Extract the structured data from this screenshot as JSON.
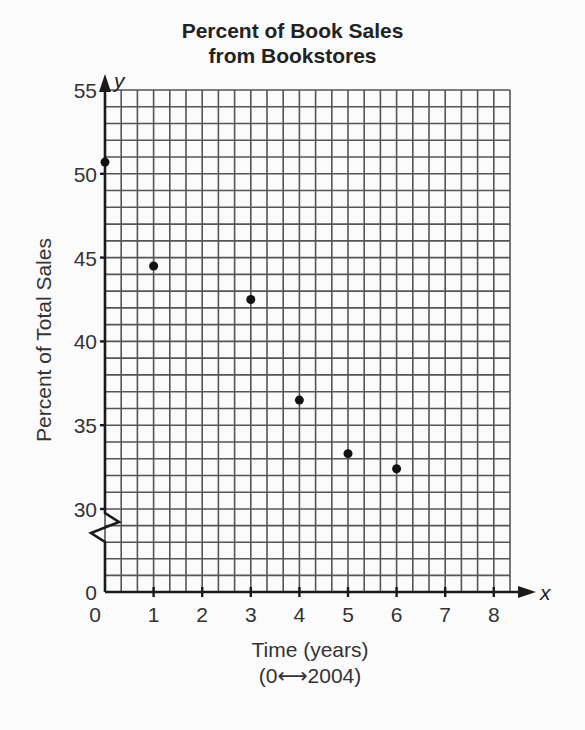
{
  "title": {
    "line1": "Percent of Book Sales",
    "line2": "from Bookstores"
  },
  "axes": {
    "y_letter": "y",
    "x_letter": "x",
    "y_title": "Percent of Total Sales",
    "x_title_line1": "Time (years)",
    "x_title_line2": "(0⟷2004)"
  },
  "chart_data": {
    "type": "scatter",
    "title": "Percent of Book Sales from Bookstores",
    "xlabel": "Time (years) (0 ↔ 2004)",
    "ylabel": "Percent of Total Sales",
    "x": [
      0,
      1,
      3,
      4,
      5,
      6
    ],
    "y": [
      50.7,
      44.5,
      42.5,
      36.5,
      33.3,
      32.4
    ],
    "xlim": [
      0,
      8.33
    ],
    "ylim": [
      0,
      55
    ],
    "y_axis_break": "between 0 and 30",
    "x_ticks": [
      "0",
      "1",
      "2",
      "3",
      "4",
      "5",
      "6",
      "7",
      "8"
    ],
    "y_ticks": [
      "0",
      "30",
      "35",
      "40",
      "45",
      "50",
      "55"
    ],
    "grid": true,
    "grid_minor_x": 0.3333,
    "grid_minor_y": 1,
    "legend": null
  },
  "colors": {
    "grid": "#555555",
    "axis": "#1a1a1a",
    "point": "#111111"
  }
}
